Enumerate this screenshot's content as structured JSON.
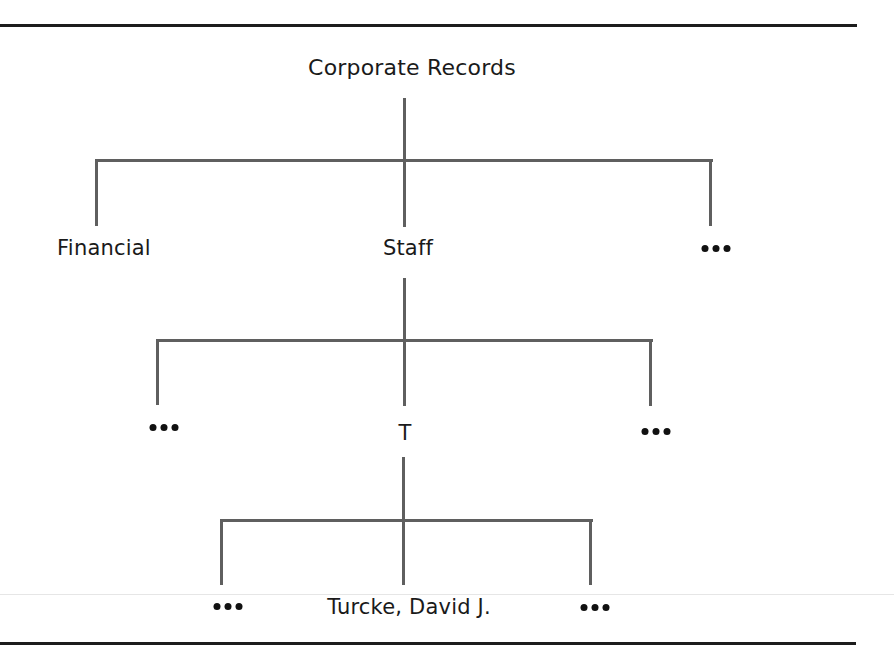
{
  "diagram": {
    "type": "hierarchy-tree",
    "root": {
      "label": "Corporate Records",
      "children": [
        {
          "label": "Financial"
        },
        {
          "label": "Staff",
          "children": [
            {
              "label": "..."
            },
            {
              "label": "T",
              "children": [
                {
                  "label": "..."
                },
                {
                  "label": "Turcke, David J."
                },
                {
                  "label": "..."
                }
              ]
            },
            {
              "label": "..."
            }
          ]
        },
        {
          "label": "..."
        }
      ]
    }
  },
  "nodes": {
    "root": "Corporate Records",
    "level1_left": "Financial",
    "level1_center": "Staff",
    "level1_right": "ellipsis",
    "level2_left": "ellipsis",
    "level2_center": "T",
    "level2_right": "ellipsis",
    "level3_left": "ellipsis",
    "level3_center": "Turcke, David J.",
    "level3_right": "ellipsis"
  },
  "colors": {
    "rule": "#1c1c1c",
    "connector": "#5f5f5f",
    "text": "#1a1a1a"
  }
}
